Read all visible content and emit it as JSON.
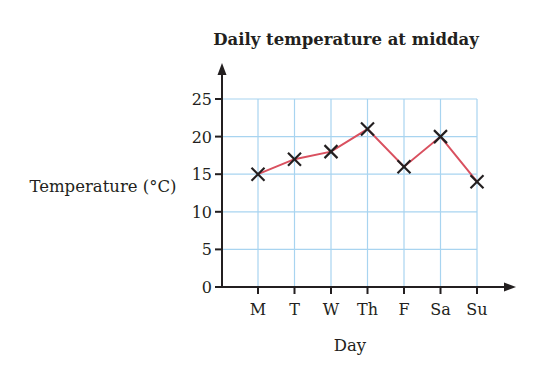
{
  "chart_data": {
    "type": "line",
    "title": "Daily temperature at midday",
    "xlabel": "Day",
    "ylabel": "Temperature (°C)",
    "categories": [
      "M",
      "T",
      "W",
      "Th",
      "F",
      "Sa",
      "Su"
    ],
    "values": [
      15,
      17,
      18,
      21,
      16,
      20,
      14
    ],
    "series": [
      {
        "name": "Temperature",
        "values": [
          15,
          17,
          18,
          21,
          16,
          20,
          14
        ]
      }
    ],
    "ylim": [
      0,
      25
    ],
    "yticks": [
      0,
      5,
      10,
      15,
      20,
      25
    ],
    "grid": true,
    "legend": "none",
    "marker": "x",
    "colors": {
      "line": "#d9505f",
      "grid": "#a8d4f0",
      "axis": "#231f20",
      "marker": "#231f20"
    }
  }
}
